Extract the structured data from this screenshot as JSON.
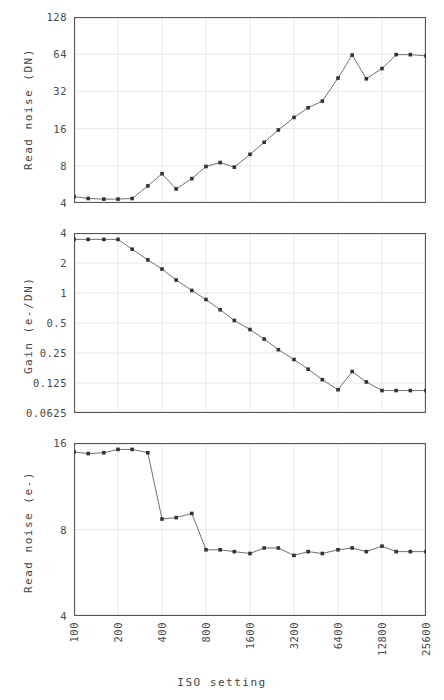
{
  "figure": {
    "xlabel": "ISO setting",
    "xticks": [
      "100",
      "200",
      "400",
      "800",
      "1600",
      "3200",
      "6400",
      "12800",
      "25600"
    ],
    "line_color": "#707070",
    "marker_color": "#333333",
    "axis_color": "#555555",
    "grid_color": "#e8e8ee",
    "background": "#ffffff"
  },
  "chart_data": [
    {
      "type": "line",
      "title": "",
      "xlabel": "ISO setting",
      "ylabel": "Read noise (DN)",
      "xscale": "log",
      "yscale": "log",
      "xlim": [
        100,
        25600
      ],
      "ylim": [
        4,
        128
      ],
      "xticks": [
        100,
        200,
        400,
        800,
        1600,
        3200,
        6400,
        12800,
        25600
      ],
      "yticks": [
        4,
        8,
        16,
        32,
        64,
        128
      ],
      "ytick_labels": [
        "4",
        "8",
        "16",
        "32",
        "64",
        "128"
      ],
      "grid": true,
      "legend": "none",
      "markers": true,
      "x": [
        100,
        125,
        160,
        200,
        250,
        320,
        400,
        500,
        640,
        800,
        1000,
        1250,
        1600,
        2000,
        2500,
        3200,
        4000,
        5000,
        6400,
        8000,
        10000,
        12800,
        16000,
        20000,
        25600
      ],
      "values": [
        4.5,
        4.35,
        4.3,
        4.3,
        4.35,
        5.5,
        6.9,
        5.2,
        6.3,
        7.9,
        8.5,
        7.8,
        9.9,
        12.4,
        15.6,
        19.7,
        23.6,
        26.7,
        41.0,
        63.0,
        40.5,
        49.0,
        63.5,
        63.5,
        62.0
      ]
    },
    {
      "type": "line",
      "title": "",
      "xlabel": "ISO setting",
      "ylabel": "Gain (e-/DN)",
      "xscale": "log",
      "yscale": "log",
      "xlim": [
        100,
        25600
      ],
      "ylim": [
        0.0625,
        4
      ],
      "xticks": [
        100,
        200,
        400,
        800,
        1600,
        3200,
        6400,
        12800,
        25600
      ],
      "yticks": [
        0.0625,
        0.125,
        0.25,
        0.5,
        1,
        2,
        4
      ],
      "ytick_labels": [
        "0.0625",
        "0.125",
        "0.25",
        "0.5",
        "1",
        "2",
        "4"
      ],
      "grid": true,
      "legend": "none",
      "markers": true,
      "x": [
        100,
        125,
        160,
        200,
        250,
        320,
        400,
        500,
        640,
        800,
        1000,
        1250,
        1600,
        2000,
        2500,
        3200,
        4000,
        5000,
        6400,
        8000,
        10000,
        12800,
        16000,
        20000,
        25600
      ],
      "values": [
        3.45,
        3.45,
        3.45,
        3.45,
        2.75,
        2.15,
        1.74,
        1.35,
        1.06,
        0.86,
        0.68,
        0.53,
        0.43,
        0.345,
        0.27,
        0.215,
        0.172,
        0.135,
        0.107,
        0.163,
        0.128,
        0.105,
        0.105,
        0.105,
        0.105
      ]
    },
    {
      "type": "line",
      "title": "",
      "xlabel": "ISO setting",
      "ylabel": "Read noise (e-)",
      "xscale": "log",
      "yscale": "log",
      "xlim": [
        100,
        25600
      ],
      "ylim": [
        4,
        16
      ],
      "xticks": [
        100,
        200,
        400,
        800,
        1600,
        3200,
        6400,
        12800,
        25600
      ],
      "yticks": [
        4,
        8,
        16
      ],
      "ytick_labels": [
        "4",
        "8",
        "16"
      ],
      "grid": true,
      "legend": "none",
      "markers": true,
      "x": [
        100,
        125,
        160,
        200,
        250,
        320,
        400,
        500,
        640,
        800,
        1000,
        1250,
        1600,
        2000,
        2500,
        3200,
        4000,
        5000,
        6400,
        8000,
        10000,
        12800,
        16000,
        20000,
        25600
      ],
      "values": [
        14.9,
        14.7,
        14.8,
        15.2,
        15.2,
        14.8,
        8.7,
        8.8,
        9.1,
        6.8,
        6.8,
        6.7,
        6.6,
        6.9,
        6.9,
        6.5,
        6.7,
        6.6,
        6.8,
        6.9,
        6.7,
        7.0,
        6.7,
        6.7,
        6.7
      ]
    }
  ]
}
